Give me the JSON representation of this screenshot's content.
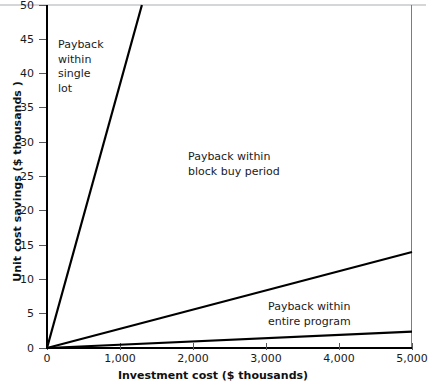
{
  "chart_data": {
    "type": "line",
    "title": "",
    "xlabel": "Investment cost ($ thousands)",
    "ylabel": "Unit cost savings ($ thousands )",
    "xlim": [
      0,
      5000
    ],
    "ylim": [
      0,
      50
    ],
    "grid": false,
    "legend_position": "none",
    "xticks": [
      "0",
      "1,000",
      "2,000",
      "3,000",
      "4,000",
      "5,000"
    ],
    "xtick_values": [
      0,
      1000,
      2000,
      3000,
      4000,
      5000
    ],
    "yticks": [
      "0",
      "5",
      "10",
      "15",
      "20",
      "25",
      "30",
      "35",
      "40",
      "45",
      "50"
    ],
    "ytick_values": [
      0,
      5,
      10,
      15,
      20,
      25,
      30,
      35,
      40,
      45,
      50
    ],
    "series": [
      {
        "name": "Payback within single lot boundary",
        "x": [
          0,
          1300
        ],
        "values": [
          0,
          50
        ],
        "slope_per_thousand": 0.03846,
        "color": "#000000"
      },
      {
        "name": "Payback within block buy period boundary",
        "x": [
          0,
          5000
        ],
        "values": [
          0,
          14
        ],
        "slope_per_thousand": 0.0028,
        "color": "#000000"
      },
      {
        "name": "Payback within entire program boundary",
        "x": [
          0,
          5000
        ],
        "values": [
          0,
          2.4
        ],
        "slope_per_thousand": 0.00048,
        "color": "#000000"
      }
    ],
    "annotations": [
      {
        "text": "Payback\nwithin\nsingle\nlot",
        "x": 150,
        "y": 45
      },
      {
        "text": "Payback within\nblock buy period",
        "x": 1950,
        "y": 27
      },
      {
        "text": "Payback within\nentire program",
        "x": 3050,
        "y": 7
      }
    ]
  },
  "axes": {
    "x_title": "Investment cost ($ thousands)",
    "y_title": "Unit cost savings ($ thousands )",
    "x_tick_labels": [
      "0",
      "1,000",
      "2,000",
      "3,000",
      "4,000",
      "5,000"
    ],
    "y_tick_labels": [
      "0",
      "5",
      "10",
      "15",
      "20",
      "25",
      "30",
      "35",
      "40",
      "45",
      "50"
    ]
  },
  "annotations": {
    "single_lot": "Payback\nwithin\nsingle\nlot",
    "block_buy": "Payback within\nblock buy period",
    "entire_program": "Payback within\nentire program"
  },
  "colors": {
    "line": "#000000",
    "axis": "#000000",
    "tick": "#55585b",
    "frame_light": "#d4d6d8",
    "background": "#ffffff",
    "text": "#1a1a1a"
  }
}
